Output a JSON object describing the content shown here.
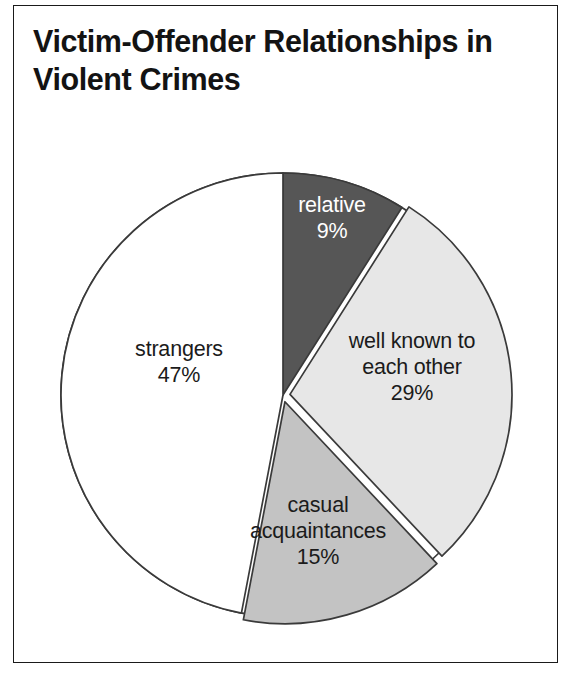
{
  "frame": {
    "border_color": "#1a1a1a"
  },
  "title": {
    "line1": "Victim-Offender Relationships in",
    "line2": "Violent Crimes",
    "color": "#131313"
  },
  "chart_data": {
    "type": "pie",
    "title": "Victim-Offender Relationships in Violent Crimes",
    "xlabel": "",
    "ylabel": "",
    "legend_position": "none",
    "grid": false,
    "value_unit": "percent",
    "start_angle_oclock": 12,
    "direction": "clockwise",
    "categories": [
      "relative",
      "well known to each other",
      "casual acquaintances",
      "strangers"
    ],
    "values": [
      9,
      29,
      15,
      47
    ],
    "slices": [
      {
        "label": "relative",
        "value": 9,
        "value_text": "9%",
        "label_lines": [
          "relative",
          "9%"
        ],
        "color": "#565656",
        "text_color": "#ffffff",
        "exploded": false,
        "label_x": 332,
        "label_y": 218
      },
      {
        "label": "well known to each other",
        "value": 29,
        "value_text": "29%",
        "label_lines": [
          "well known to",
          "each other",
          "29%"
        ],
        "color": "#e7e7e7",
        "text_color": "#1b1b1b",
        "exploded": true,
        "label_x": 412,
        "label_y": 367
      },
      {
        "label": "casual acquaintances",
        "value": 15,
        "value_text": "15%",
        "label_lines": [
          "casual",
          "acquaintances",
          "15%"
        ],
        "color": "#c3c3c3",
        "text_color": "#1b1b1b",
        "exploded": true,
        "label_x": 318,
        "label_y": 531
      },
      {
        "label": "strangers",
        "value": 47,
        "value_text": "47%",
        "label_lines": [
          "strangers",
          "47%"
        ],
        "color": "#ffffff",
        "text_color": "#1b1b1b",
        "exploded": false,
        "label_x": 179,
        "label_y": 362
      }
    ]
  }
}
